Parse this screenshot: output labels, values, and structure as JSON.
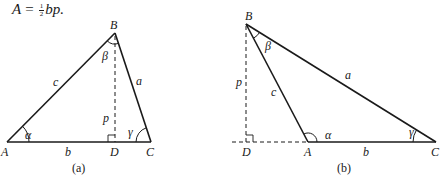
{
  "formula": {
    "lhs": "A",
    "equals": "=",
    "frac_num": "1",
    "frac_den": "2",
    "rhs": "bp."
  },
  "figures": [
    {
      "caption": "(a)",
      "vertices": {
        "A": {
          "label": "A",
          "x": 7,
          "y": 142
        },
        "B": {
          "label": "B",
          "x": 115,
          "y": 33
        },
        "C": {
          "label": "C",
          "x": 151,
          "y": 142
        },
        "D": {
          "label": "D",
          "x": 115,
          "y": 142
        }
      },
      "sides": {
        "a": "a",
        "b": "b",
        "c": "c",
        "p": "p"
      },
      "angles": {
        "alpha": "α",
        "beta": "β",
        "gamma": "γ"
      },
      "description": "Acute triangle ABC with altitude p from B to foot D on side AC"
    },
    {
      "caption": "(b)",
      "vertices": {
        "A": {
          "label": "A",
          "x": 308,
          "y": 142
        },
        "B": {
          "label": "B",
          "x": 246,
          "y": 24
        },
        "C": {
          "label": "C",
          "x": 436,
          "y": 142
        },
        "D": {
          "label": "D",
          "x": 246,
          "y": 142
        }
      },
      "sides": {
        "a": "a",
        "b": "b",
        "c": "c",
        "p": "p"
      },
      "angles": {
        "alpha": "α",
        "beta": "β",
        "gamma": "γ"
      },
      "description": "Obtuse triangle ABC with altitude p from B to foot D on extension of side CA"
    }
  ],
  "colors": {
    "stroke": "#1a1a1a",
    "background": "#ffffff"
  }
}
